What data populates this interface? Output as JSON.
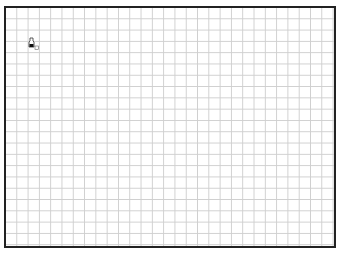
{
  "canvas": {
    "type": "grid-drawing-area",
    "grid_color": "#cfcfcf",
    "border_color": "#222222",
    "background": "#ffffff"
  },
  "cursor": {
    "icon": "pen-cursor-icon"
  }
}
